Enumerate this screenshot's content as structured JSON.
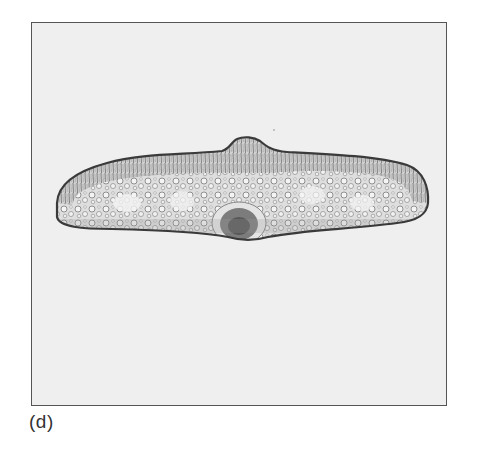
{
  "figure": {
    "panel_label": "(d)",
    "colors": {
      "background": "#ffffff",
      "frame_fill": "#efefef",
      "frame_border": "#555555",
      "epidermis": "#3a3a3a",
      "mesophyll": "#8a8a8a",
      "vascular_bundle": "#5a5a5a"
    }
  }
}
